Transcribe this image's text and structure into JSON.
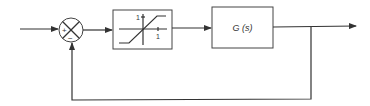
{
  "diagram": {
    "type": "feedback-control-loop",
    "summing_junction": {
      "plus_sign": "+",
      "minus_sign": "−"
    },
    "saturation_block": {
      "label_y": "1",
      "label_x": "1"
    },
    "plant_block": {
      "label": "G (s)"
    },
    "colors": {
      "line": "#333333",
      "background": "#ffffff"
    }
  }
}
